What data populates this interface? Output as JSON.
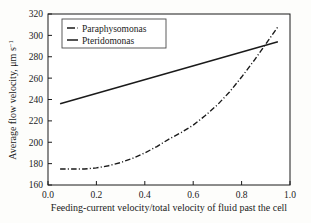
{
  "chart_data": {
    "type": "line",
    "title": "",
    "xlabel": "Feeding-current velocity/total velocity of fluid past the cell",
    "ylabel": "Average flow velocity, μm s",
    "ylabel_sup": "−1",
    "xlim": [
      0.0,
      1.0
    ],
    "ylim": [
      160,
      320
    ],
    "xticks": [
      "0.0",
      "0.2",
      "0.4",
      "0.6",
      "0.8",
      "1.0"
    ],
    "xtick_values": [
      0.0,
      0.2,
      0.4,
      0.6,
      0.8,
      1.0
    ],
    "yticks": [
      "160",
      "180",
      "200",
      "220",
      "240",
      "260",
      "280",
      "300",
      "320"
    ],
    "ytick_values": [
      160,
      180,
      200,
      220,
      240,
      260,
      280,
      300,
      320
    ],
    "grid": false,
    "legend_position": "upper-left",
    "series": [
      {
        "name": "Paraphysomonas",
        "style": "dash-dot",
        "color": "#1a1a1a",
        "x": [
          0.05,
          0.1,
          0.15,
          0.2,
          0.25,
          0.3,
          0.35,
          0.4,
          0.45,
          0.5,
          0.55,
          0.6,
          0.65,
          0.7,
          0.75,
          0.8,
          0.85,
          0.9,
          0.95
        ],
        "y": [
          175,
          175,
          175,
          176,
          178,
          181,
          185,
          190,
          196,
          203,
          209,
          216,
          225,
          235,
          247,
          261,
          276,
          292,
          308
        ]
      },
      {
        "name": "Pteridomonas",
        "style": "solid",
        "color": "#1a1a1a",
        "x": [
          0.05,
          0.95
        ],
        "y": [
          236,
          294
        ]
      }
    ]
  },
  "legend": {
    "entries": [
      {
        "label": "Paraphysomonas",
        "style": "dash-dot"
      },
      {
        "label": "Pteridomonas",
        "style": "solid"
      }
    ]
  }
}
